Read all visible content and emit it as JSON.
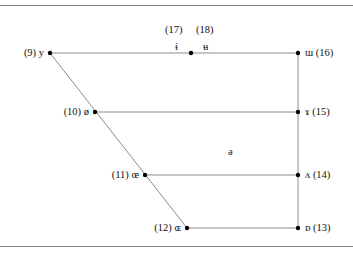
{
  "diagram": {
    "type": "vowel-trapezoid",
    "line_color": "#8c8c8c",
    "dot_color": "#000000",
    "left_vowels": [
      {
        "number": "(9)",
        "symbol": "y",
        "label": "(9) y"
      },
      {
        "number": "(10)",
        "symbol": "ø",
        "label": "(10) ø"
      },
      {
        "number": "(11)",
        "symbol": "œ",
        "label": "(11) œ"
      },
      {
        "number": "(12)",
        "symbol": "ɶ",
        "label": "(12) ɶ"
      }
    ],
    "right_vowels": [
      {
        "number": "(16)",
        "symbol": "ɯ",
        "label": "ɯ (16)"
      },
      {
        "number": "(15)",
        "symbol": "ɤ",
        "label": "ɤ (15)"
      },
      {
        "number": "(14)",
        "symbol": "ʌ",
        "label": "ʌ (14)"
      },
      {
        "number": "(13)",
        "symbol": "ɒ",
        "label": "ɒ (13)"
      }
    ],
    "central_vowels": [
      {
        "number": "(17)",
        "symbol": "ɨ"
      },
      {
        "number": "(18)",
        "symbol": "ʉ"
      }
    ],
    "schwa": {
      "symbol": "ə"
    }
  }
}
